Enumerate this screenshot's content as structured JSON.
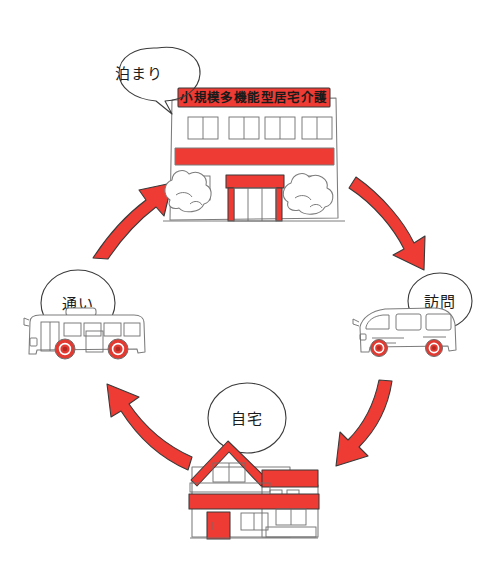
{
  "figure": {
    "title": "小規模多機能型居宅介護",
    "layout": "cycle",
    "background_color": "#ffffff",
    "accent_color": "#ee3b33",
    "ink_color": "#3b3b3b"
  },
  "facility": {
    "sign_label": "小規模多機能型居宅介護",
    "bubble_label": "泊まり",
    "icon_name": "care-facility-building",
    "upper_window_count": 4
  },
  "nodes": [
    {
      "id": "stay",
      "bubble_label": "泊まり",
      "icon_name": "care-facility-building",
      "position": "top"
    },
    {
      "id": "visit",
      "bubble_label": "訪問",
      "icon_name": "care-van",
      "position": "right"
    },
    {
      "id": "home",
      "bubble_label": "自宅",
      "icon_name": "house",
      "position": "bottom"
    },
    {
      "id": "commute",
      "bubble_label": "通い",
      "icon_name": "bus",
      "position": "left"
    }
  ],
  "arrows": [
    {
      "id": "arrow-facility-to-van",
      "from": "stay",
      "to": "visit",
      "direction": "down-right",
      "color": "#ee3b33"
    },
    {
      "id": "arrow-van-to-home",
      "from": "visit",
      "to": "home",
      "direction": "down-left",
      "color": "#ee3b33"
    },
    {
      "id": "arrow-home-to-bus",
      "from": "home",
      "to": "commute",
      "direction": "up-left",
      "color": "#ee3b33"
    },
    {
      "id": "arrow-bus-to-facility",
      "from": "commute",
      "to": "stay",
      "direction": "up-right",
      "color": "#ee3b33"
    }
  ]
}
